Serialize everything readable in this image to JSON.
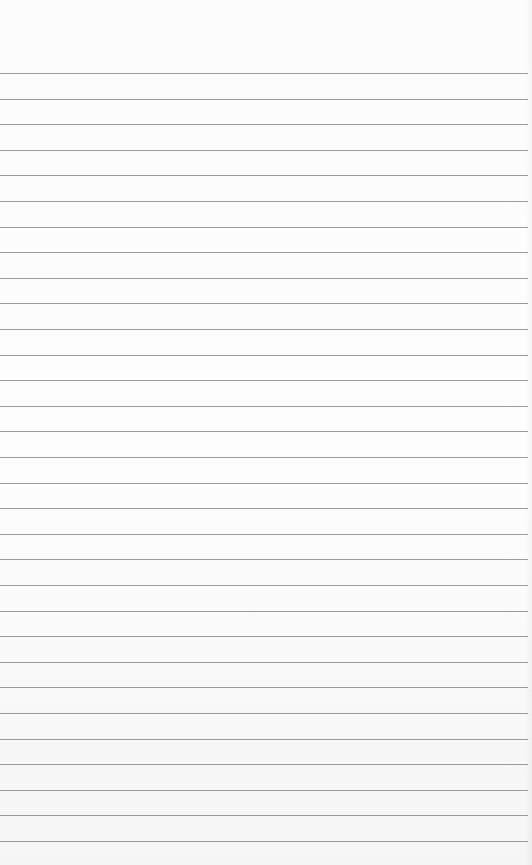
{
  "paper": {
    "type": "lined-notepad",
    "background_color": "#fcfcfc",
    "line_color": "#8a8a8a",
    "first_line_y": 73,
    "line_spacing": 25.6,
    "line_count": 31,
    "text": ""
  }
}
